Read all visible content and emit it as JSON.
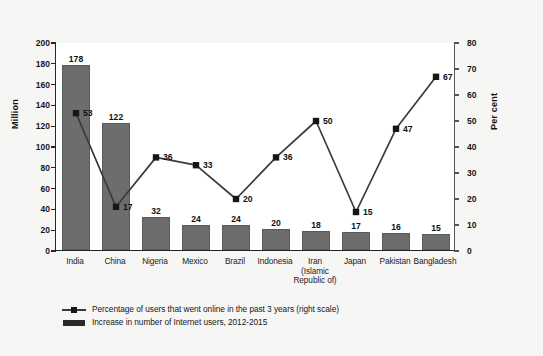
{
  "chart_data": {
    "type": "bar",
    "title": "",
    "subtitle": "",
    "xlabel": "",
    "ylabel": "Million",
    "y2label": "Per cent",
    "ylim": [
      0,
      200
    ],
    "y2lim": [
      0,
      80
    ],
    "yticks": [
      0,
      20,
      40,
      60,
      80,
      100,
      120,
      140,
      160,
      180,
      200
    ],
    "y2ticks": [
      0,
      10,
      20,
      30,
      40,
      50,
      60,
      70,
      80
    ],
    "grid": false,
    "legend_position": "bottom-left",
    "categories": [
      "India",
      "China",
      "Nigeria",
      "Mexico",
      "Brazil",
      "Indonesia",
      "Iran\n(Islamic\nRepublic of)",
      "Japan",
      "Pakistan",
      "Bangladesh"
    ],
    "series": [
      {
        "name": "Increase in number of Internet users, 2012-2015",
        "type": "bar",
        "axis": "left",
        "unit": "Million",
        "color": "#6d6d6d",
        "values": [
          178,
          122,
          32,
          24,
          24,
          20,
          18,
          17,
          16,
          15
        ]
      },
      {
        "name": "Percentage of users that went online in the past 3 years (right scale)",
        "type": "line",
        "axis": "right",
        "unit": "Per cent",
        "color": "#3b3b3e",
        "values": [
          53,
          17,
          36,
          33,
          20,
          36,
          50,
          15,
          47,
          67
        ]
      }
    ]
  },
  "legend": {
    "items": [
      {
        "key": "line-marker",
        "label": "Percentage of users that went online in the past 3 years (right scale)"
      },
      {
        "key": "bar-swatch",
        "label": "Increase in number of Internet users, 2012-2015"
      }
    ]
  },
  "caption": {
    "text": ""
  },
  "colors": {
    "bar": "#6d6d6d",
    "line": "#3b3b3e",
    "marker": "#161618",
    "axis": "#262626",
    "plot_background": "#ffffff",
    "page_background": "#f6f6f5"
  }
}
